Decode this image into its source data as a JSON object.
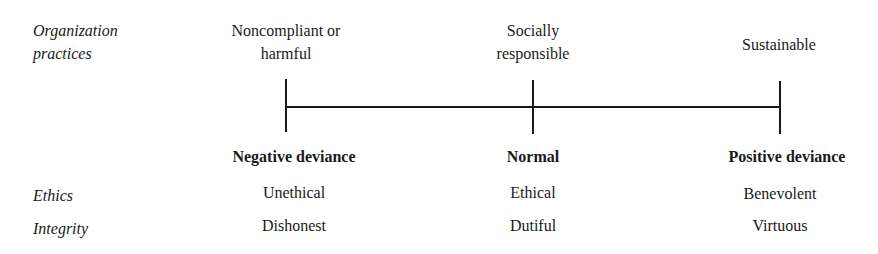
{
  "row_labels": {
    "practices": [
      "Organization",
      "practices"
    ],
    "ethics": "Ethics",
    "integrity": "Integrity"
  },
  "columns": [
    {
      "practice": [
        "Noncompliant or",
        "harmful"
      ],
      "category": "Negative deviance",
      "ethics": "Unethical",
      "integrity": "Dishonest"
    },
    {
      "practice": [
        "Socially",
        "responsible"
      ],
      "category": "Normal",
      "ethics": "Ethical",
      "integrity": "Dutiful"
    },
    {
      "practice": [
        "Sustainable"
      ],
      "category": "Positive deviance",
      "ethics": "Benevolent",
      "integrity": "Virtuous"
    }
  ],
  "colors": {
    "ink": "#1a1a1a",
    "background": "#ffffff"
  }
}
